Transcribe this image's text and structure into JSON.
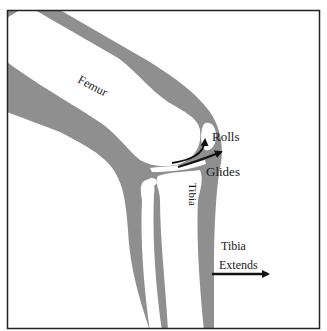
{
  "diagram": {
    "colors": {
      "background": "#ffffff",
      "soft_tissue": "#8f8f8f",
      "bone": "#ffffff",
      "frame": "#222222",
      "arrow": "#111111",
      "text": "#1a1a1a"
    },
    "labels": {
      "femur": "Femur",
      "rolls": "Rolls",
      "glides": "Glides",
      "tibia": "Tibia",
      "tibia_extends_line1": "Tibia",
      "tibia_extends_line2": "Extends"
    },
    "parts": [
      {
        "name": "thigh-soft-tissue",
        "type": "region"
      },
      {
        "name": "femur-bone",
        "type": "bone",
        "label": "Femur"
      },
      {
        "name": "patella",
        "type": "bone"
      },
      {
        "name": "tibia-bone",
        "type": "bone",
        "label": "Tibia"
      },
      {
        "name": "fibula-bone",
        "type": "bone"
      },
      {
        "name": "lower-leg-soft-tissue",
        "type": "region"
      }
    ],
    "arrows": [
      {
        "name": "rolls-arrow",
        "direction": "up",
        "label": "Rolls"
      },
      {
        "name": "glides-arrow",
        "direction": "up-right",
        "label": "Glides"
      },
      {
        "name": "tibia-extends-arrow",
        "direction": "right",
        "label": "Tibia Extends"
      }
    ]
  }
}
